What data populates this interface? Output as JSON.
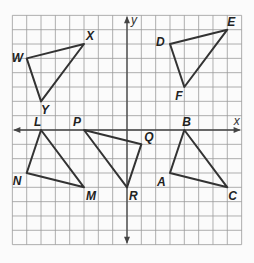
{
  "diagram": {
    "type": "coordinate-grid",
    "grid": {
      "cells_x": 16,
      "cells_y": 16,
      "x_range": [
        -8,
        8
      ],
      "y_range": [
        -8,
        8
      ]
    },
    "axes": {
      "x_label": "x",
      "y_label": "y"
    },
    "colors": {
      "grid": "#9a9a9a",
      "axis": "#444444",
      "triangle": "#333333",
      "background": "#fbfbfb"
    },
    "triangles": [
      {
        "name": "WXY",
        "vertices": [
          {
            "label": "W",
            "x": -7,
            "y": 5
          },
          {
            "label": "X",
            "x": -3,
            "y": 6
          },
          {
            "label": "Y",
            "x": -6,
            "y": 2
          }
        ]
      },
      {
        "name": "DEF",
        "vertices": [
          {
            "label": "D",
            "x": 3,
            "y": 6
          },
          {
            "label": "E",
            "x": 7,
            "y": 7
          },
          {
            "label": "F",
            "x": 4,
            "y": 3
          }
        ]
      },
      {
        "name": "LMN",
        "vertices": [
          {
            "label": "L",
            "x": -6,
            "y": 0
          },
          {
            "label": "M",
            "x": -3,
            "y": -4
          },
          {
            "label": "N",
            "x": -7,
            "y": -3
          }
        ]
      },
      {
        "name": "PQR",
        "vertices": [
          {
            "label": "P",
            "x": -3,
            "y": 0
          },
          {
            "label": "Q",
            "x": 1,
            "y": -1
          },
          {
            "label": "R",
            "x": 0,
            "y": -4
          }
        ]
      },
      {
        "name": "ABC",
        "vertices": [
          {
            "label": "A",
            "x": 3,
            "y": -3
          },
          {
            "label": "B",
            "x": 4,
            "y": 0
          },
          {
            "label": "C",
            "x": 7,
            "y": -4
          }
        ]
      }
    ]
  }
}
